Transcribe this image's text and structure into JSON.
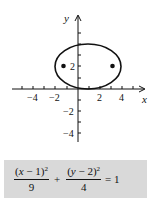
{
  "figure": {
    "axes": {
      "x_label": "x",
      "y_label": "y",
      "x_tick_labels": [
        "−4",
        "−2",
        "2",
        "4"
      ],
      "y_tick_labels": [
        "2",
        "−2",
        "−4"
      ],
      "x_range": [
        -6,
        6
      ],
      "y_range": [
        -5,
        5
      ]
    },
    "ellipse": {
      "center": [
        1,
        2
      ],
      "a": 3,
      "b": 2,
      "foci": [
        [
          -1.24,
          2
        ],
        [
          3.24,
          2
        ]
      ]
    },
    "colors": {
      "ink": "#111111",
      "equation_background": "#d9d9d9"
    }
  },
  "equation": {
    "term1_numerator_open": "(",
    "term1_var": "x",
    "term1_numerator_rest": " − 1)",
    "term1_exponent": "2",
    "term1_denominator": "9",
    "plus": "+",
    "term2_numerator_open": "(",
    "term2_var": "y",
    "term2_numerator_rest": " − 2)",
    "term2_exponent": "2",
    "term2_denominator": "4",
    "equals": "= 1"
  }
}
